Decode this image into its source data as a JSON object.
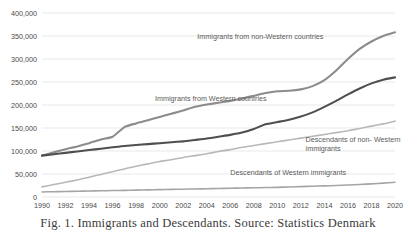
{
  "figure": {
    "caption": "Fig. 1.  Immigrants and Descendants. Source: Statistics Denmark"
  },
  "chart_data": {
    "type": "line",
    "title": "",
    "xlabel": "",
    "ylabel": "",
    "xlim": [
      1990,
      2020
    ],
    "ylim": [
      0,
      400000
    ],
    "grid": true,
    "legend_position": "inline-annotations",
    "x": [
      1990,
      1991,
      1992,
      1993,
      1994,
      1995,
      1996,
      1997,
      1998,
      1999,
      2000,
      2001,
      2002,
      2003,
      2004,
      2005,
      2006,
      2007,
      2008,
      2009,
      2010,
      2011,
      2012,
      2013,
      2014,
      2015,
      2016,
      2017,
      2018,
      2019,
      2020
    ],
    "x_tick_labels": [
      "1990",
      "1992",
      "1994",
      "1996",
      "1998",
      "2000",
      "2002",
      "2004",
      "2006",
      "2008",
      "2010",
      "2012",
      "2014",
      "2016",
      "2018",
      "2020"
    ],
    "y_tick_values": [
      0,
      50000,
      100000,
      150000,
      200000,
      250000,
      300000,
      350000,
      400000
    ],
    "y_tick_labels": [
      "0",
      "50,000",
      "100,000",
      "150,000",
      "200,000",
      "250,000",
      "300,000",
      "350,000",
      "400,000"
    ],
    "series": [
      {
        "name": "Immigrants from non-Western countries",
        "color": "#8c8c8c",
        "width": 2.1,
        "label_x": 2003.2,
        "label_y": 343000,
        "values": [
          90000,
          97000,
          104000,
          110000,
          117000,
          125000,
          131000,
          152000,
          160000,
          167000,
          174000,
          181000,
          188000,
          196000,
          201000,
          205000,
          209000,
          214000,
          220000,
          226000,
          230000,
          231000,
          234000,
          241000,
          254000,
          275000,
          300000,
          322000,
          338000,
          350000,
          358000
        ]
      },
      {
        "name": "Immigrants from Western countries",
        "color": "#4f4f4f",
        "width": 2.1,
        "label_x": 1999.6,
        "label_y": 209000,
        "values": [
          90000,
          93000,
          96000,
          99000,
          102000,
          105000,
          108000,
          111000,
          113000,
          115000,
          117000,
          119000,
          121000,
          124000,
          127000,
          131000,
          135000,
          140000,
          148000,
          158000,
          163000,
          168000,
          175000,
          184000,
          196000,
          209000,
          223000,
          236000,
          247000,
          255000,
          260000
        ]
      },
      {
        "name": "Descendants of non- Western immigrants",
        "color": "#b8b8b8",
        "width": 1.6,
        "label_x": 2012.4,
        "label_y": 120000,
        "values": [
          22000,
          27000,
          32000,
          37000,
          43000,
          49000,
          55000,
          61000,
          67000,
          72000,
          77000,
          81000,
          86000,
          90000,
          94000,
          99000,
          103000,
          108000,
          112000,
          116000,
          120000,
          124000,
          128000,
          132000,
          136000,
          140000,
          144000,
          149000,
          154000,
          159000,
          165000
        ]
      },
      {
        "name": "Descendants of Western immigrants",
        "color": "#a5a5a5",
        "width": 1.6,
        "label_x": 2006.0,
        "label_y": 47000,
        "values": [
          11000,
          11500,
          12000,
          12500,
          13000,
          13500,
          14000,
          14500,
          15000,
          15500,
          16000,
          16500,
          17000,
          17500,
          18000,
          18500,
          19000,
          19500,
          20000,
          20500,
          21000,
          21800,
          22600,
          23400,
          24200,
          25000,
          26000,
          27200,
          28600,
          30200,
          32000
        ]
      }
    ]
  }
}
